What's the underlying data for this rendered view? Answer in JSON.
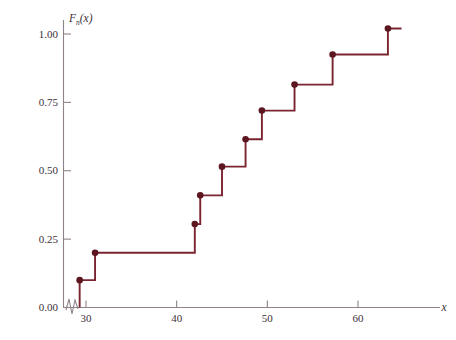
{
  "chart_data": {
    "type": "line",
    "title": "",
    "subtitle": "",
    "xlabel": "x",
    "ylabel": "F_n(x)",
    "ylabel_base": "F",
    "ylabel_sub": "n",
    "ylabel_arg": "(x)",
    "xlim": [
      28.0,
      64.8
    ],
    "ylim": [
      0.0,
      1.08
    ],
    "grid": false,
    "legend": null,
    "axis_break": true,
    "axis_break_note": "zigzag break on x-axis just right of origin",
    "xticks": [
      30,
      40,
      50,
      60
    ],
    "xtick_labels": [
      "30",
      "40",
      "50",
      "60"
    ],
    "yticks": [
      0.0,
      0.25,
      0.5,
      0.75,
      1.0
    ],
    "ytick_labels": [
      "0.00",
      "0.25",
      "0.50",
      "0.75",
      "1.00"
    ],
    "series": [
      {
        "name": "Empirical distribution function",
        "style": "step-post",
        "color": "#7a2430",
        "marker": "filled-circle",
        "x": [
          29.3,
          31.0,
          42.0,
          42.6,
          45.0,
          47.6,
          49.4,
          53.0,
          57.2,
          63.3
        ],
        "y": [
          0.1,
          0.2,
          0.305,
          0.41,
          0.515,
          0.615,
          0.72,
          0.815,
          0.925,
          1.02
        ],
        "x_end": 64.8
      }
    ],
    "points": [
      {
        "x": 29.3,
        "y": 0.1
      },
      {
        "x": 31.0,
        "y": 0.2
      },
      {
        "x": 42.0,
        "y": 0.305
      },
      {
        "x": 42.6,
        "y": 0.41
      },
      {
        "x": 45.0,
        "y": 0.515
      },
      {
        "x": 47.6,
        "y": 0.615
      },
      {
        "x": 49.4,
        "y": 0.72
      },
      {
        "x": 53.0,
        "y": 0.815
      },
      {
        "x": 57.2,
        "y": 0.925
      },
      {
        "x": 63.3,
        "y": 1.02
      }
    ]
  },
  "colors": {
    "step_line": "#7a2430",
    "marker": "#5c1620",
    "axis": "#8f8289",
    "tick_text": "#3a3038",
    "background": "#ffffff"
  }
}
